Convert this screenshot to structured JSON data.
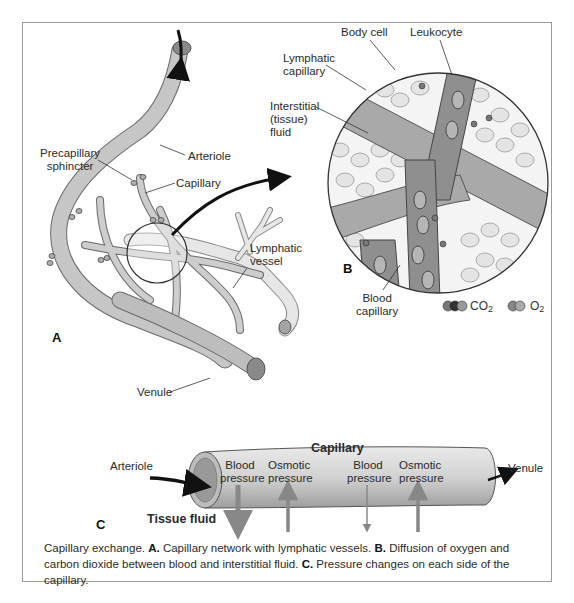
{
  "figure": {
    "panel_a": {
      "letter": "A",
      "labels": {
        "precapillary_sphincter_1": "Precapillary",
        "precapillary_sphincter_2": "sphincter",
        "arteriole": "Arteriole",
        "capillary": "Capillary",
        "lymphatic_vessel_1": "Lymphatic",
        "lymphatic_vessel_2": "vessel",
        "venule": "Venule"
      }
    },
    "panel_b": {
      "letter": "B",
      "labels": {
        "body_cell": "Body cell",
        "leukocyte": "Leukocyte",
        "lymphatic_capillary_1": "Lymphatic",
        "lymphatic_capillary_2": "capillary",
        "interstitial_1": "Interstitial",
        "interstitial_2": "(tissue)",
        "interstitial_3": "fluid",
        "blood_capillary_1": "Blood",
        "blood_capillary_2": "capillary"
      },
      "legend": {
        "co2_label": "CO",
        "co2_sub": "2",
        "o2_label": "O",
        "o2_sub": "2"
      }
    },
    "panel_c": {
      "letter": "C",
      "title": "Capillary",
      "arteriole": "Arteriole",
      "venule": "Venule",
      "tissue_fluid": "Tissue fluid",
      "pressures": [
        {
          "line1": "Blood",
          "line2": "pressure",
          "direction": "out"
        },
        {
          "line1": "Osmotic",
          "line2": "pressure",
          "direction": "in"
        },
        {
          "line1": "Blood",
          "line2": "pressure",
          "direction": "out"
        },
        {
          "line1": "Osmotic",
          "line2": "pressure",
          "direction": "in"
        }
      ]
    },
    "caption": {
      "intro": "Capillary exchange. ",
      "a_letter": "A.",
      "a_text": " Capillary network with lymphatic vessels. ",
      "b_letter": "B.",
      "b_text": " Diffusion of oxygen and carbon dioxide between blood and interstitial fluid. ",
      "c_letter": "C.",
      "c_text": " Pressure changes on each side of the capillary."
    },
    "colors": {
      "vessel": "#c8c8c8",
      "vessel_dark": "#8d8d8d",
      "lymph": "#e2e2e2",
      "cell_fill": "#e6e6e6",
      "outline": "#555555"
    }
  }
}
